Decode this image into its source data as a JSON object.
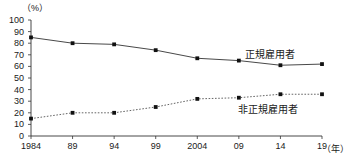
{
  "chart_data": {
    "type": "line",
    "title": "",
    "xlabel": "年",
    "ylabel": "%",
    "y_unit_label": "（%）",
    "x_unit_label": "（年）",
    "x": [
      1984,
      1989,
      1994,
      1999,
      2004,
      2009,
      2014,
      2019
    ],
    "categories": [
      "1984",
      "89",
      "94",
      "99",
      "2004",
      "09",
      "14",
      "19"
    ],
    "ylim": [
      0,
      100
    ],
    "yticks": [
      0,
      10,
      20,
      30,
      40,
      50,
      60,
      70,
      80,
      90,
      100
    ],
    "ytick_labels": [
      "0",
      "10",
      "20",
      "30",
      "40",
      "50",
      "60",
      "70",
      "80",
      "90",
      "100"
    ],
    "grid": false,
    "legend_position": "inline-right",
    "series": [
      {
        "name": "正規雇用者",
        "style": "solid",
        "color": "#333333",
        "marker": "square",
        "values": [
          85,
          80,
          79,
          74,
          67,
          65,
          61,
          62
        ]
      },
      {
        "name": "非正規雇用者",
        "style": "dotted",
        "color": "#555555",
        "marker": "square",
        "values": [
          15,
          20,
          20,
          25,
          32,
          33,
          36,
          36
        ]
      }
    ],
    "annotations": [
      {
        "name": "正規雇用者",
        "x": 2013,
        "y": 72
      },
      {
        "name": "非正規雇用者",
        "x": 2012,
        "y": 25
      }
    ]
  },
  "axes": {
    "y_unit": "（%）",
    "x_unit": "（年）"
  }
}
